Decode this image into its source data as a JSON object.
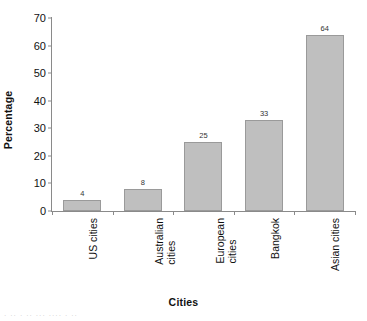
{
  "chart_data": {
    "type": "bar",
    "title": "",
    "xlabel": "Cities",
    "ylabel": "Percentage",
    "categories": [
      "US cities",
      "Australian cities",
      "European cities",
      "Bangkok",
      "Asian cities"
    ],
    "category_lines": [
      [
        "US cities"
      ],
      [
        "Australian",
        "cities"
      ],
      [
        "European",
        "cities"
      ],
      [
        "Bangkok"
      ],
      [
        "Asian cities"
      ]
    ],
    "values": [
      4,
      8,
      25,
      33,
      64
    ],
    "value_labels": [
      "4",
      "8",
      "25",
      "33",
      "64"
    ],
    "ylim": [
      0,
      70
    ],
    "ytick_labels": [
      "0",
      "10",
      "20",
      "30",
      "40",
      "50",
      "60",
      "70"
    ],
    "ytick_values": [
      0,
      10,
      20,
      30,
      40,
      50,
      60,
      70
    ],
    "grid": false,
    "legend": false,
    "bar_color": "#bfbfbf",
    "bar_border_color": "#9a9a9a",
    "axis_color": "#8a8a8a"
  },
  "artifact": {
    "text": "· ·· ·  ·· ···   ···· · ··"
  }
}
